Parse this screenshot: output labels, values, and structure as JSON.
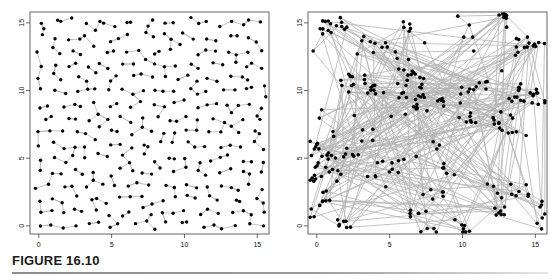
{
  "figure": {
    "caption_label": "FIGURE 16.10",
    "background_color": "#ffffff",
    "rule_color": "#8d8d8d"
  },
  "colors": {
    "point": "#000000",
    "edge": "#b4b4b4",
    "frame": "#555555",
    "axis_text": "#111111"
  },
  "chart_data": [
    {
      "type": "scatter",
      "panel": "left",
      "title": "",
      "xlabel": "",
      "ylabel": "",
      "xlim": [
        -0.6,
        15.8
      ],
      "ylim": [
        -0.6,
        15.8
      ],
      "xticks": [
        0,
        5,
        10,
        15
      ],
      "yticks": [
        0,
        5,
        10,
        15
      ],
      "xtick_labels": [
        "0",
        "5",
        "10",
        "15"
      ],
      "ytick_labels": [
        "0",
        "5",
        "10",
        "15"
      ],
      "grid": false,
      "legend": "none",
      "point_count": 300,
      "edge_style": "nearest-neighbour short segments",
      "points": [
        [
          0.0,
          15.0
        ],
        [
          0.4,
          14.8
        ],
        [
          1.2,
          15.1
        ],
        [
          1.6,
          14.95
        ],
        [
          2.4,
          15.2
        ],
        [
          3.3,
          15.0
        ],
        [
          4.0,
          14.9
        ],
        [
          4.6,
          15.05
        ],
        [
          5.4,
          14.9
        ],
        [
          6.0,
          15.1
        ],
        [
          6.4,
          14.85
        ],
        [
          7.3,
          15.0
        ],
        [
          7.9,
          14.95
        ],
        [
          8.7,
          15.15
        ],
        [
          9.4,
          14.9
        ],
        [
          10.2,
          15.4
        ],
        [
          10.9,
          14.9
        ],
        [
          11.6,
          15.05
        ],
        [
          12.4,
          14.8
        ],
        [
          13.1,
          15.0
        ],
        [
          13.9,
          14.95
        ],
        [
          14.6,
          15.2
        ],
        [
          15.3,
          14.9
        ],
        [
          0.2,
          13.9
        ],
        [
          0.9,
          14.1
        ],
        [
          1.8,
          13.8
        ],
        [
          2.6,
          14.0
        ],
        [
          3.4,
          13.9
        ],
        [
          4.1,
          14.2
        ],
        [
          4.9,
          13.85
        ],
        [
          5.6,
          14.0
        ],
        [
          6.3,
          13.9
        ],
        [
          7.1,
          14.1
        ],
        [
          7.8,
          13.8
        ],
        [
          8.6,
          14.0
        ],
        [
          9.3,
          13.9
        ],
        [
          10.1,
          14.15
        ],
        [
          10.8,
          13.9
        ],
        [
          11.5,
          14.0
        ],
        [
          12.3,
          13.85
        ],
        [
          13.0,
          14.1
        ],
        [
          13.8,
          13.9
        ],
        [
          14.5,
          14.0
        ],
        [
          15.2,
          13.8
        ],
        [
          0.0,
          12.9
        ],
        [
          0.8,
          13.1
        ],
        [
          1.5,
          12.8
        ],
        [
          2.3,
          13.0
        ],
        [
          3.1,
          12.9
        ],
        [
          3.9,
          13.2
        ],
        [
          4.7,
          12.85
        ],
        [
          5.4,
          13.0
        ],
        [
          6.2,
          12.9
        ],
        [
          6.9,
          13.1
        ],
        [
          7.7,
          12.8
        ],
        [
          8.4,
          13.0
        ],
        [
          9.2,
          12.9
        ],
        [
          9.9,
          13.15
        ],
        [
          10.7,
          12.9
        ],
        [
          11.4,
          13.0
        ],
        [
          12.2,
          12.85
        ],
        [
          13.0,
          13.1
        ],
        [
          13.7,
          12.9
        ],
        [
          14.4,
          13.0
        ],
        [
          15.1,
          12.85
        ],
        [
          0.3,
          11.9
        ],
        [
          1.1,
          12.1
        ],
        [
          1.9,
          11.8
        ],
        [
          2.7,
          12.0
        ],
        [
          3.5,
          11.9
        ],
        [
          4.3,
          12.2
        ],
        [
          5.0,
          11.85
        ],
        [
          5.8,
          12.0
        ],
        [
          6.5,
          11.9
        ],
        [
          7.3,
          12.1
        ],
        [
          8.1,
          11.8
        ],
        [
          8.8,
          12.0
        ],
        [
          9.6,
          11.9
        ],
        [
          10.3,
          12.15
        ],
        [
          11.1,
          11.9
        ],
        [
          11.8,
          12.0
        ],
        [
          12.6,
          11.85
        ],
        [
          13.3,
          12.1
        ],
        [
          14.1,
          11.9
        ],
        [
          14.8,
          12.0
        ],
        [
          15.4,
          11.85
        ],
        [
          0.1,
          10.9
        ],
        [
          0.9,
          11.1
        ],
        [
          1.7,
          10.8
        ],
        [
          2.5,
          11.0
        ],
        [
          3.2,
          10.9
        ],
        [
          4.0,
          11.2
        ],
        [
          4.8,
          10.85
        ],
        [
          5.5,
          11.0
        ],
        [
          6.3,
          10.9
        ],
        [
          7.0,
          11.1
        ],
        [
          7.8,
          10.8
        ],
        [
          8.6,
          11.0
        ],
        [
          9.3,
          10.9
        ],
        [
          10.1,
          11.15
        ],
        [
          10.8,
          10.9
        ],
        [
          11.6,
          11.0
        ],
        [
          12.3,
          10.85
        ],
        [
          13.1,
          11.1
        ],
        [
          13.8,
          10.9
        ],
        [
          14.6,
          11.0
        ],
        [
          15.3,
          10.5
        ],
        [
          0.2,
          9.9
        ],
        [
          1.0,
          10.1
        ],
        [
          1.8,
          9.8
        ],
        [
          2.6,
          10.0
        ],
        [
          3.4,
          9.9
        ],
        [
          4.1,
          10.2
        ],
        [
          4.9,
          9.85
        ],
        [
          5.7,
          10.0
        ],
        [
          6.4,
          9.9
        ],
        [
          7.2,
          10.1
        ],
        [
          7.9,
          9.8
        ],
        [
          8.7,
          10.0
        ],
        [
          9.5,
          9.9
        ],
        [
          10.2,
          10.15
        ],
        [
          11.0,
          9.9
        ],
        [
          11.7,
          10.0
        ],
        [
          12.5,
          9.85
        ],
        [
          13.2,
          10.1
        ],
        [
          14.0,
          9.9
        ],
        [
          14.7,
          10.0
        ],
        [
          15.4,
          9.8
        ],
        [
          0.0,
          8.9
        ],
        [
          0.8,
          9.1
        ],
        [
          1.6,
          8.8
        ],
        [
          2.4,
          9.0
        ],
        [
          3.1,
          8.9
        ],
        [
          3.9,
          9.2
        ],
        [
          4.7,
          8.85
        ],
        [
          5.4,
          9.0
        ],
        [
          6.2,
          8.9
        ],
        [
          7.0,
          9.1
        ],
        [
          7.7,
          8.8
        ],
        [
          8.5,
          9.0
        ],
        [
          9.2,
          8.9
        ],
        [
          10.0,
          9.15
        ],
        [
          10.7,
          8.9
        ],
        [
          11.5,
          9.0
        ],
        [
          12.3,
          8.85
        ],
        [
          13.0,
          9.1
        ],
        [
          13.8,
          8.9
        ],
        [
          14.5,
          9.0
        ],
        [
          15.2,
          8.85
        ],
        [
          0.3,
          7.9
        ],
        [
          1.1,
          8.1
        ],
        [
          1.9,
          7.8
        ],
        [
          2.6,
          8.0
        ],
        [
          3.4,
          7.9
        ],
        [
          4.2,
          8.2
        ],
        [
          4.9,
          7.85
        ],
        [
          5.7,
          8.0
        ],
        [
          6.5,
          7.9
        ],
        [
          7.2,
          8.1
        ],
        [
          8.0,
          7.8
        ],
        [
          8.8,
          8.0
        ],
        [
          9.5,
          7.9
        ],
        [
          10.3,
          8.15
        ],
        [
          11.0,
          7.9
        ],
        [
          11.8,
          8.0
        ],
        [
          12.6,
          7.85
        ],
        [
          13.3,
          8.1
        ],
        [
          14.1,
          7.9
        ],
        [
          14.8,
          8.0
        ],
        [
          15.4,
          7.85
        ],
        [
          0.1,
          6.9
        ],
        [
          0.9,
          7.1
        ],
        [
          1.7,
          6.8
        ],
        [
          2.5,
          7.0
        ],
        [
          3.2,
          6.9
        ],
        [
          4.0,
          7.2
        ],
        [
          4.8,
          6.85
        ],
        [
          5.5,
          7.0
        ],
        [
          6.3,
          6.9
        ],
        [
          7.1,
          7.1
        ],
        [
          7.8,
          6.8
        ],
        [
          8.6,
          7.0
        ],
        [
          9.4,
          6.9
        ],
        [
          10.1,
          7.15
        ],
        [
          10.9,
          6.9
        ],
        [
          11.6,
          7.0
        ],
        [
          12.4,
          6.85
        ],
        [
          13.1,
          7.1
        ],
        [
          13.9,
          6.9
        ],
        [
          14.6,
          7.0
        ],
        [
          15.3,
          6.85
        ],
        [
          0.0,
          5.9
        ],
        [
          0.8,
          6.1
        ],
        [
          1.6,
          5.8
        ],
        [
          2.4,
          6.0
        ],
        [
          3.1,
          5.9
        ],
        [
          3.9,
          6.2
        ],
        [
          4.7,
          5.85
        ],
        [
          5.5,
          6.0
        ],
        [
          6.2,
          5.9
        ],
        [
          7.0,
          6.1
        ],
        [
          7.7,
          5.8
        ],
        [
          8.5,
          6.0
        ],
        [
          9.3,
          5.9
        ],
        [
          10.0,
          6.15
        ],
        [
          10.8,
          5.9
        ],
        [
          11.5,
          6.0
        ],
        [
          12.3,
          5.85
        ],
        [
          13.0,
          6.1
        ],
        [
          13.8,
          5.9
        ],
        [
          14.6,
          6.0
        ],
        [
          15.3,
          5.85
        ],
        [
          0.2,
          4.9
        ],
        [
          1.0,
          5.1
        ],
        [
          1.8,
          4.8
        ],
        [
          2.6,
          5.0
        ],
        [
          3.3,
          4.9
        ],
        [
          4.1,
          5.2
        ],
        [
          4.9,
          4.85
        ],
        [
          5.6,
          5.0
        ],
        [
          6.4,
          4.9
        ],
        [
          7.2,
          5.1
        ],
        [
          7.9,
          4.8
        ],
        [
          8.7,
          5.0
        ],
        [
          9.4,
          4.9
        ],
        [
          10.2,
          5.15
        ],
        [
          11.0,
          4.9
        ],
        [
          11.7,
          5.0
        ],
        [
          12.5,
          4.85
        ],
        [
          13.2,
          5.1
        ],
        [
          14.0,
          4.9
        ],
        [
          14.7,
          5.0
        ],
        [
          15.4,
          4.85
        ],
        [
          0.1,
          3.9
        ],
        [
          0.9,
          4.1
        ],
        [
          1.7,
          3.8
        ],
        [
          2.4,
          4.0
        ],
        [
          3.2,
          3.9
        ],
        [
          4.0,
          4.2
        ],
        [
          4.7,
          3.85
        ],
        [
          5.5,
          4.0
        ],
        [
          6.3,
          3.9
        ],
        [
          7.0,
          4.1
        ],
        [
          7.8,
          3.8
        ],
        [
          8.6,
          4.0
        ],
        [
          9.3,
          3.9
        ],
        [
          10.1,
          4.15
        ],
        [
          10.8,
          3.9
        ],
        [
          11.6,
          4.0
        ],
        [
          12.4,
          3.85
        ],
        [
          13.1,
          4.1
        ],
        [
          13.9,
          3.9
        ],
        [
          14.6,
          4.0
        ],
        [
          15.3,
          3.85
        ],
        [
          0.0,
          2.9
        ],
        [
          0.8,
          3.1
        ],
        [
          1.6,
          2.8
        ],
        [
          2.3,
          3.0
        ],
        [
          3.1,
          2.9
        ],
        [
          3.9,
          3.2
        ],
        [
          4.6,
          2.85
        ],
        [
          5.4,
          3.0
        ],
        [
          6.2,
          2.9
        ],
        [
          6.9,
          3.1
        ],
        [
          7.7,
          2.8
        ],
        [
          8.5,
          3.0
        ],
        [
          9.2,
          2.9
        ],
        [
          10.0,
          3.15
        ],
        [
          10.7,
          2.9
        ],
        [
          11.5,
          3.0
        ],
        [
          12.3,
          2.85
        ],
        [
          13.0,
          3.1
        ],
        [
          13.8,
          2.9
        ],
        [
          14.5,
          3.0
        ],
        [
          15.2,
          2.85
        ],
        [
          0.3,
          1.9
        ],
        [
          1.1,
          2.1
        ],
        [
          1.8,
          1.8
        ],
        [
          2.6,
          2.0
        ],
        [
          3.4,
          1.9
        ],
        [
          4.1,
          2.2
        ],
        [
          4.9,
          1.85
        ],
        [
          5.7,
          2.0
        ],
        [
          6.4,
          1.9
        ],
        [
          7.2,
          2.1
        ],
        [
          8.0,
          1.8
        ],
        [
          8.7,
          2.0
        ],
        [
          9.5,
          1.9
        ],
        [
          10.2,
          2.15
        ],
        [
          11.0,
          1.9
        ],
        [
          11.8,
          2.0
        ],
        [
          12.5,
          1.85
        ],
        [
          13.3,
          2.1
        ],
        [
          14.0,
          1.9
        ],
        [
          14.8,
          2.0
        ],
        [
          15.4,
          1.85
        ],
        [
          0.1,
          0.9
        ],
        [
          0.9,
          1.1
        ],
        [
          1.7,
          0.8
        ],
        [
          2.5,
          1.0
        ],
        [
          3.2,
          0.9
        ],
        [
          4.0,
          1.2
        ],
        [
          4.8,
          0.85
        ],
        [
          5.5,
          1.0
        ],
        [
          6.3,
          0.9
        ],
        [
          7.1,
          1.1
        ],
        [
          7.8,
          0.8
        ],
        [
          8.6,
          1.0
        ],
        [
          9.3,
          0.9
        ],
        [
          10.1,
          1.15
        ],
        [
          10.9,
          0.9
        ],
        [
          11.6,
          1.0
        ],
        [
          12.4,
          0.85
        ],
        [
          13.1,
          1.1
        ],
        [
          13.9,
          0.9
        ],
        [
          14.6,
          1.0
        ],
        [
          15.3,
          0.85
        ],
        [
          0.0,
          0.0
        ],
        [
          0.8,
          0.2
        ],
        [
          1.6,
          -0.1
        ],
        [
          2.4,
          0.1
        ],
        [
          3.2,
          0.0
        ],
        [
          4.0,
          0.2
        ],
        [
          4.8,
          -0.1
        ],
        [
          5.6,
          0.1
        ],
        [
          6.4,
          0.0
        ],
        [
          7.2,
          0.2
        ],
        [
          8.0,
          -0.1
        ],
        [
          8.8,
          0.1
        ],
        [
          9.6,
          0.0
        ],
        [
          10.4,
          0.2
        ],
        [
          11.2,
          -0.1
        ],
        [
          12.0,
          0.1
        ],
        [
          12.8,
          0.0
        ],
        [
          13.6,
          0.2
        ],
        [
          14.4,
          -0.1
        ],
        [
          15.2,
          0.1
        ]
      ]
    },
    {
      "type": "scatter",
      "panel": "right",
      "title": "",
      "xlabel": "",
      "ylabel": "",
      "xlim": [
        -0.6,
        15.8
      ],
      "ylim": [
        -0.6,
        15.8
      ],
      "xticks": [
        0,
        5,
        10,
        15
      ],
      "yticks": [
        0,
        5,
        10,
        15
      ],
      "xtick_labels": [
        "0",
        "5",
        "10",
        "15"
      ],
      "ytick_labels": [
        "0",
        "5",
        "10",
        "15"
      ],
      "grid": false,
      "legend": "none",
      "point_count": 300,
      "edge_style": "long-range network segments, clustered points"
    }
  ]
}
